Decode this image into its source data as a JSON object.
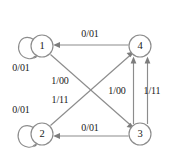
{
  "diagram": {
    "type": "state-transition-diagram",
    "colors": {
      "background": "#ffffff",
      "stroke": "#8c8c8c",
      "arrow": "#7d7d7d",
      "text": "#1a1a1a"
    },
    "states": [
      {
        "id": "1",
        "label": "1",
        "cx": 42,
        "cy": 46,
        "r": 11
      },
      {
        "id": "4",
        "label": "4",
        "cx": 140,
        "cy": 46,
        "r": 11
      },
      {
        "id": "2",
        "label": "2",
        "cx": 42,
        "cy": 134,
        "r": 11
      },
      {
        "id": "3",
        "label": "3",
        "cx": 140,
        "cy": 134,
        "r": 11
      }
    ],
    "transitions": [
      {
        "from": "4",
        "to": "1",
        "label": "0/01",
        "label_x": 90,
        "label_y": 34,
        "kind": "straight-horizontal-top"
      },
      {
        "from": "3",
        "to": "2",
        "label": "0/01",
        "label_x": 90,
        "label_y": 128,
        "kind": "straight-horizontal-bottom"
      },
      {
        "from": "1",
        "to": "1",
        "label": "0/01",
        "label_x": 21,
        "label_y": 68,
        "kind": "self-loop"
      },
      {
        "from": "2",
        "to": "2",
        "label": "0/01",
        "label_x": 21,
        "label_y": 110,
        "kind": "self-loop"
      },
      {
        "from": "1",
        "to": "3",
        "label": "1/00",
        "label_x": 60,
        "label_y": 81,
        "kind": "diagonal-down-right"
      },
      {
        "from": "2",
        "to": "4",
        "label": "1/11",
        "label_x": 60,
        "label_y": 100,
        "kind": "diagonal-up-right"
      },
      {
        "from": "3",
        "to": "4",
        "label": "1/00",
        "label_x": 117,
        "label_y": 91,
        "kind": "vertical-inner"
      },
      {
        "from": "3",
        "to": "4",
        "label": "1/11",
        "label_x": 152,
        "label_y": 91,
        "kind": "vertical-outer"
      }
    ]
  }
}
